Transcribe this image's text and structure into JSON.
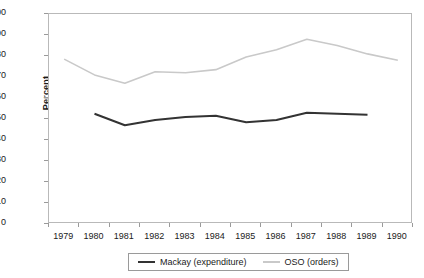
{
  "chart_data": {
    "type": "line",
    "title": "",
    "xlabel": "",
    "ylabel": "Percent",
    "ylim": [
      0,
      100
    ],
    "ytick_step": 10,
    "grid": false,
    "legend_position": "bottom",
    "x": [
      1979,
      1980,
      1981,
      1982,
      1983,
      1984,
      1985,
      1986,
      1987,
      1988,
      1989,
      1990
    ],
    "xtick_labels": [
      "1979",
      "1980",
      "1981",
      "1982",
      "1983",
      "1984",
      "1985",
      "1986",
      "1987",
      "1988",
      "1989",
      "1990"
    ],
    "ytick_labels": [
      "100",
      "90",
      "80",
      "70",
      "60",
      "50",
      "40",
      "30",
      "20",
      "10",
      "0"
    ],
    "series": [
      {
        "name": "Mackay (expenditure)",
        "color": "#333333",
        "x": [
          1980,
          1981,
          1982,
          1983,
          1984,
          1985,
          1986,
          1987,
          1988,
          1989
        ],
        "values": [
          52.5,
          47.0,
          49.5,
          51.0,
          51.5,
          48.5,
          49.5,
          53.0,
          52.5,
          52.0
        ]
      },
      {
        "name": "OSO (orders)",
        "color": "#c9c9c9",
        "x": [
          1979,
          1980,
          1981,
          1982,
          1983,
          1984,
          1985,
          1986,
          1987,
          1988,
          1989,
          1990
        ],
        "values": [
          78.5,
          71.0,
          67.0,
          72.5,
          72.0,
          73.5,
          79.5,
          83.0,
          88.0,
          85.0,
          81.0,
          78.0
        ]
      }
    ]
  },
  "legend": {
    "items": [
      {
        "label": "Mackay (expenditure)",
        "color": "#333333"
      },
      {
        "label": "OSO (orders)",
        "color": "#c9c9c9"
      }
    ]
  }
}
